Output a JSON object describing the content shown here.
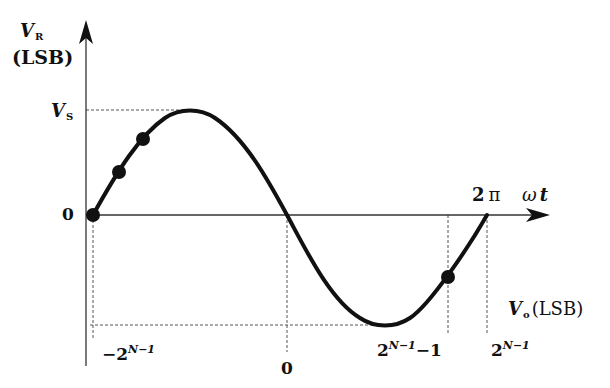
{
  "figure": {
    "y_axis": {
      "symbol": "V",
      "subscript": "R",
      "unit": "(LSB)",
      "ticks": {
        "vs_symbol": "V",
        "vs_subscript": "S",
        "zero": "0"
      }
    },
    "x_axis_time": {
      "label": "ωt",
      "label_omega": "ω",
      "label_t": "t",
      "period_label": "2π",
      "period_num": "2",
      "period_pi": "π"
    },
    "x_axis_code": {
      "symbol": "V",
      "subscript": "o",
      "unit": "(LSB)",
      "ticks": [
        {
          "prefix": "−2",
          "exp": "N−1",
          "suffix": ""
        },
        {
          "prefix": "0",
          "exp": "",
          "suffix": ""
        },
        {
          "prefix": "2",
          "exp": "N−1",
          "suffix": "−1"
        },
        {
          "prefix": "2",
          "exp": "N−1",
          "suffix": ""
        }
      ]
    },
    "curve": {
      "type": "sine",
      "description": "One full period of a sine wave from 0 to 2π, amplitude V_S, with sampled points marked"
    },
    "sample_points": [
      {
        "label": "start",
        "phase": "0"
      },
      {
        "label": "p1"
      },
      {
        "label": "p2"
      },
      {
        "label": "p_last"
      }
    ],
    "colors": {
      "curve": "#111111",
      "axis": "#333333",
      "dashed": "#555555",
      "background": "#ffffff"
    }
  }
}
